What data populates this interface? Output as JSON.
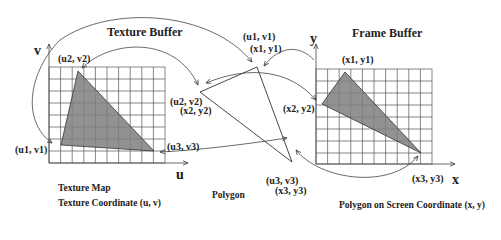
{
  "diagram": {
    "titles": {
      "texture_buffer": "Texture Buffer",
      "frame_buffer": "Frame Buffer"
    },
    "texture_panel": {
      "axis_v": "v",
      "axis_u": "u",
      "caption_line1": "Texture Map",
      "caption_line2": "Texture Coordinate (u, v)",
      "vertices": {
        "v1": "(u1, v1)",
        "v2": "(u2, v2)",
        "v3": "(u3, v3)"
      },
      "grid": {
        "columns": 10,
        "rows": 8
      }
    },
    "polygon_panel": {
      "caption": "Polygon",
      "vertex1_tex": "(u1, v1)",
      "vertex1_scr": "(x1, y1)",
      "vertex2_tex": "(u2, v2)",
      "vertex2_scr": "(x2, y2)",
      "vertex3_tex": "(u3, v3)",
      "vertex3_scr": "(x3, y3)"
    },
    "frame_panel": {
      "axis_y": "y",
      "axis_x": "x",
      "caption": "Polygon on Screen Coordinate (x, y)",
      "vertices": {
        "v1": "(x1, y1)",
        "v2": "(x2, y2)",
        "v3": "(x3, y3)"
      },
      "grid": {
        "columns": 10,
        "rows": 8
      }
    },
    "colors": {
      "fill": "#7f7f7f",
      "line": "#333333",
      "grid": "#555555"
    }
  }
}
